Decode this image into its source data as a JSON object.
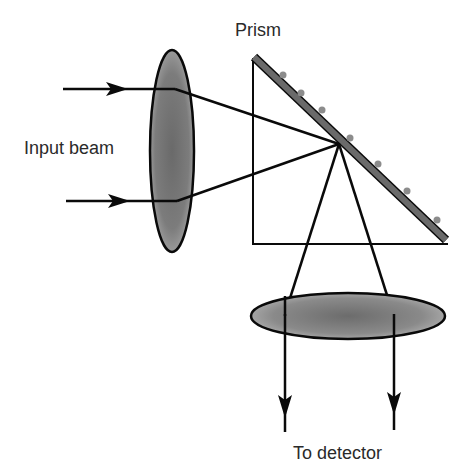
{
  "diagram": {
    "type": "optical-setup",
    "labels": {
      "prism": "Prism",
      "input_beam": "Input beam",
      "detector": "To detector"
    },
    "colors": {
      "line": "#0a0a0a",
      "lens_fill_center": "#6e6e6e",
      "lens_fill_edge": "#a8a8a8",
      "prism_surface": "#6a6a6a",
      "dots": "#8c8c8c",
      "text": "#2a2a2a"
    },
    "components": [
      {
        "name": "input-lens",
        "shape": "vertical ellipse"
      },
      {
        "name": "prism",
        "shape": "right triangle with coated hypotenuse"
      },
      {
        "name": "output-lens",
        "shape": "horizontal ellipse"
      }
    ]
  }
}
